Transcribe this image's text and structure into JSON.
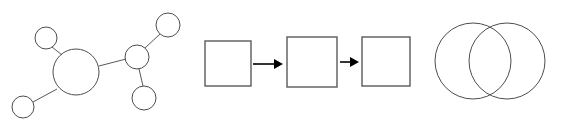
{
  "canvas": {
    "width": 563,
    "height": 121,
    "background": "#ffffff"
  },
  "palette": {
    "node_stroke": "#4d4d4d",
    "edge_stroke": "#595959",
    "box_stroke": "#5a5a5a",
    "arrow_color": "#000000",
    "venn_stroke": "#4d4d4d",
    "fill": "none"
  },
  "figures": [
    {
      "id": "network-graph",
      "type": "node-link-diagram",
      "label": "network graph",
      "origin_x": 0,
      "origin_y": 0,
      "nodes": [
        {
          "id": "hub",
          "cx": 76,
          "cy": 72,
          "r": 23,
          "role": "hub"
        },
        {
          "id": "top-left",
          "cx": 46,
          "cy": 38,
          "r": 11,
          "role": "leaf"
        },
        {
          "id": "bottom-left",
          "cx": 23,
          "cy": 107,
          "r": 11,
          "role": "leaf"
        },
        {
          "id": "junction",
          "cx": 137,
          "cy": 57,
          "r": 12,
          "role": "junction"
        },
        {
          "id": "top-right",
          "cx": 168,
          "cy": 25,
          "r": 12,
          "role": "leaf"
        },
        {
          "id": "bottom-right",
          "cx": 144,
          "cy": 98,
          "r": 12,
          "role": "leaf"
        }
      ],
      "edges": [
        {
          "from": "top-left",
          "to": "hub",
          "x1": 52,
          "y1": 47,
          "x2": 62,
          "y2": 55
        },
        {
          "from": "bottom-left",
          "to": "hub",
          "x1": 33,
          "y1": 102,
          "x2": 57,
          "y2": 89
        },
        {
          "from": "hub",
          "to": "junction",
          "x1": 99,
          "y1": 66,
          "x2": 126,
          "y2": 59
        },
        {
          "from": "junction",
          "to": "top-right",
          "x1": 145,
          "y1": 48,
          "x2": 160,
          "y2": 34
        },
        {
          "from": "junction",
          "to": "bottom-right",
          "x1": 139,
          "y1": 69,
          "x2": 143,
          "y2": 86
        }
      ]
    },
    {
      "id": "flowchart",
      "type": "process-flow",
      "label": "three step flowchart",
      "origin_x": 195,
      "origin_y": 0,
      "boxes": [
        {
          "id": "step-1",
          "x": 10,
          "y": 41,
          "width": 46,
          "height": 45,
          "label": ""
        },
        {
          "id": "step-2",
          "x": 92,
          "y": 37,
          "width": 50,
          "height": 50,
          "label": ""
        },
        {
          "id": "step-3",
          "x": 167,
          "y": 37,
          "width": 48,
          "height": 49,
          "label": ""
        }
      ],
      "arrows": [
        {
          "id": "arrow-1",
          "from": "step-1",
          "to": "step-2",
          "x1": 58,
          "y1": 64,
          "x2": 88,
          "y2": 64
        },
        {
          "id": "arrow-2",
          "from": "step-2",
          "to": "step-3",
          "x1": 145,
          "y1": 62,
          "x2": 164,
          "y2": 62
        }
      ]
    },
    {
      "id": "venn-diagram",
      "type": "venn",
      "label": "two set venn diagram",
      "origin_x": 425,
      "origin_y": 0,
      "circles": [
        {
          "id": "set-left",
          "cx": 48,
          "cy": 61,
          "r": 38,
          "label": ""
        },
        {
          "id": "set-right",
          "cx": 82,
          "cy": 61,
          "r": 38,
          "label": ""
        }
      ]
    }
  ]
}
